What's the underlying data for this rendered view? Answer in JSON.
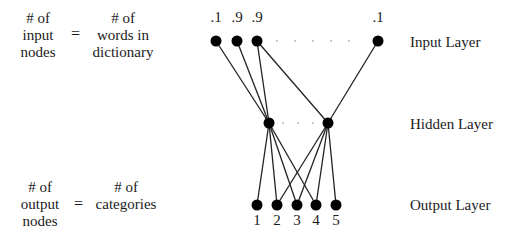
{
  "annotations": {
    "input_eq": {
      "left_lines": [
        "# of",
        "input",
        "nodes"
      ],
      "equals": "=",
      "right_lines": [
        "# of",
        "words in",
        "dictionary"
      ]
    },
    "output_eq": {
      "left_lines": [
        "# of",
        "output",
        "nodes"
      ],
      "equals": "=",
      "right_lines": [
        "# of",
        "categories"
      ]
    }
  },
  "layers": {
    "input": {
      "label": "Input Layer",
      "values": [
        ".1",
        ".9",
        ".9",
        ".1"
      ],
      "ellipsis": "· · · · ·"
    },
    "hidden": {
      "label": "Hidden Layer",
      "ellipsis": "· · ·"
    },
    "output": {
      "label": "Output Layer",
      "node_labels": [
        "1",
        "2",
        "3",
        "4",
        "5"
      ]
    }
  },
  "colors": {
    "node": "#000000",
    "edge": "#222222",
    "text": "#1a1a1a"
  }
}
